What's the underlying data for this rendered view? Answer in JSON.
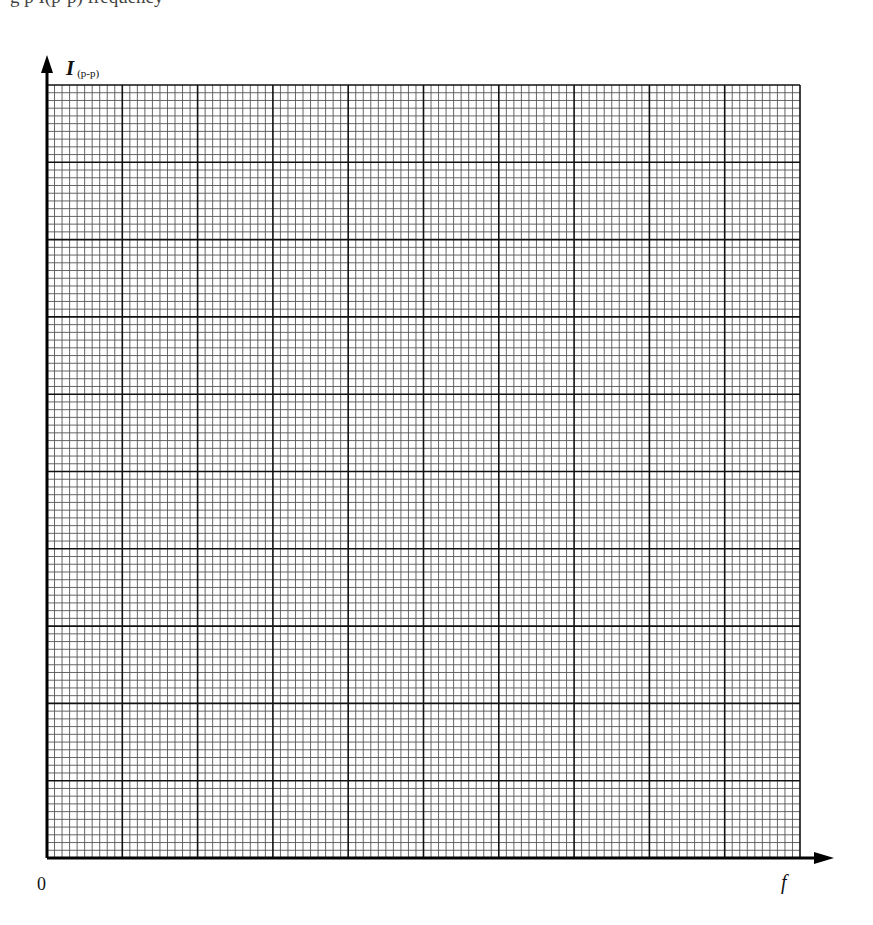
{
  "page": {
    "top_text_fragment": "g p   I(p-p)   frequency"
  },
  "chart_data": {
    "type": "line",
    "title": "",
    "xlabel": "f",
    "ylabel": "I",
    "ylabel_subscript": "(p-p)",
    "origin_label": "0",
    "x": [],
    "series": [],
    "x_ticks": [],
    "y_ticks": [],
    "grid": true,
    "grid_major_divisions_x": 10,
    "grid_major_divisions_y": 10,
    "grid_minor_per_major": 10,
    "legend": "none",
    "note": "Blank graph paper with axes only; no data plotted"
  },
  "colors": {
    "background": "#ffffff",
    "major_grid": "#111111",
    "minor_grid": "#555555",
    "axis": "#000000",
    "text": "#111111"
  },
  "layout": {
    "grid_left": 47,
    "grid_top": 85,
    "grid_right": 800,
    "grid_bottom": 858,
    "y_arrow_tip": 55,
    "x_arrow_tip": 834
  }
}
